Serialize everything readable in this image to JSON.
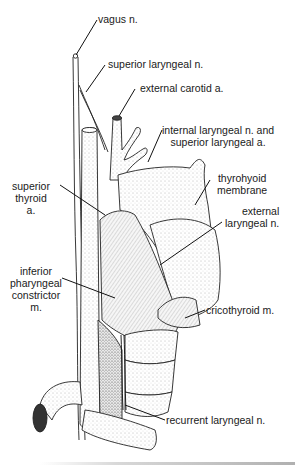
{
  "figure": {
    "labels": [
      {
        "id": "vagus",
        "text": "vagus n."
      },
      {
        "id": "superior-laryngeal-nerve",
        "text": "superior laryngeal n."
      },
      {
        "id": "external-carotid",
        "text": "external carotid a."
      },
      {
        "id": "internal-laryngeal",
        "lines": [
          "internal laryngeal n. and",
          "superior laryngeal a."
        ]
      },
      {
        "id": "superior-thyroid",
        "lines": [
          "superior",
          "thyroid",
          "a."
        ]
      },
      {
        "id": "thyrohyoid-membrane",
        "lines": [
          "thyrohyoid",
          "membrane"
        ]
      },
      {
        "id": "external-laryngeal",
        "lines": [
          "external",
          "laryngeal n."
        ]
      },
      {
        "id": "inferior-pharyngeal-constrictor",
        "lines": [
          "inferior",
          "pharyngeal",
          "constrictor",
          "m."
        ]
      },
      {
        "id": "cricothyroid",
        "text": "cricothyroid m."
      },
      {
        "id": "recurrent-laryngeal",
        "text": "recurrent laryngeal n."
      }
    ]
  }
}
